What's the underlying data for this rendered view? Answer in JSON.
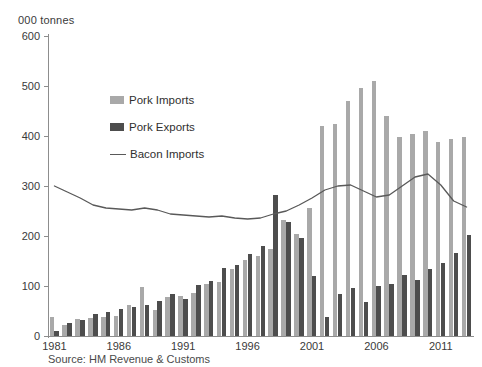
{
  "axis_unit_caption": "000 tonnes",
  "source_note": "Source: HM Revenue & Customs",
  "legend": {
    "position": "inside-upper-left",
    "items": [
      {
        "label": "Pork Imports",
        "marker": "bar-swatch",
        "color": "#a9a9a9"
      },
      {
        "label": "Pork Exports",
        "marker": "bar-swatch",
        "color": "#4d4d4d"
      },
      {
        "label": "Bacon Imports",
        "marker": "line-swatch",
        "color": "#595959"
      }
    ]
  },
  "chart_data": {
    "type": "bar",
    "title": "",
    "subtitle": "",
    "xlabel": "",
    "ylabel": "000 tonnes",
    "ylim": [
      0,
      600
    ],
    "yticks": [
      0,
      100,
      200,
      300,
      400,
      500,
      600
    ],
    "xticks": [
      1981,
      1986,
      1991,
      1996,
      2001,
      2006,
      2011
    ],
    "grid": false,
    "categories": [
      1981,
      1982,
      1983,
      1984,
      1985,
      1986,
      1987,
      1988,
      1989,
      1990,
      1991,
      1992,
      1993,
      1994,
      1995,
      1996,
      1997,
      1998,
      1999,
      2000,
      2001,
      2002,
      2003,
      2004,
      2005,
      2006,
      2007,
      2008,
      2009,
      2010,
      2011,
      2012,
      2013
    ],
    "series": [
      {
        "name": "Pork Imports",
        "type": "bar",
        "color": "#a9a9a9",
        "values": [
          38,
          22,
          34,
          36,
          38,
          40,
          62,
          98,
          52,
          78,
          80,
          86,
          104,
          108,
          134,
          152,
          160,
          174,
          232,
          204,
          256,
          420,
          424,
          470,
          496,
          510,
          440,
          398,
          404,
          410,
          388,
          394,
          398
        ]
      },
      {
        "name": "Pork Exports",
        "type": "bar",
        "color": "#4d4d4d",
        "values": [
          10,
          26,
          32,
          44,
          48,
          54,
          58,
          62,
          70,
          84,
          74,
          102,
          110,
          136,
          142,
          164,
          180,
          282,
          228,
          196,
          120,
          38,
          84,
          96,
          68,
          100,
          104,
          122,
          112,
          134,
          146,
          166,
          202
        ]
      },
      {
        "name": "Bacon Imports",
        "type": "line",
        "color": "#595959",
        "values": [
          300,
          288,
          276,
          262,
          256,
          254,
          252,
          256,
          252,
          244,
          242,
          240,
          238,
          240,
          236,
          234,
          236,
          244,
          250,
          262,
          276,
          292,
          300,
          302,
          290,
          278,
          282,
          300,
          318,
          324,
          302,
          270,
          258
        ]
      }
    ]
  }
}
